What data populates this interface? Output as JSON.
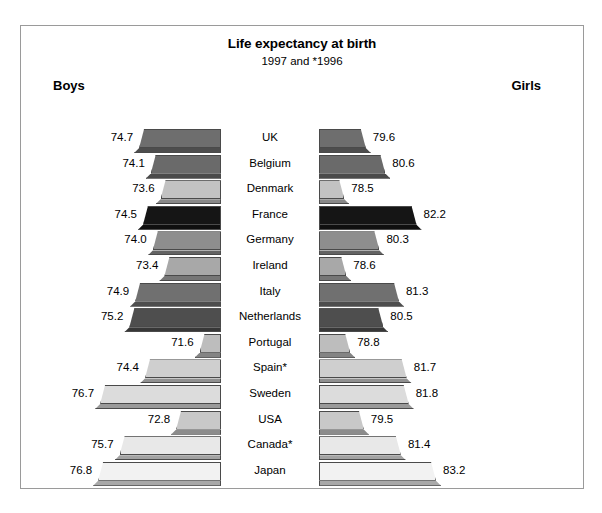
{
  "header": {
    "title": "Life expectancy at birth",
    "subtitle": "1997 and *1996",
    "boys_label": "Boys",
    "girls_label": "Girls"
  },
  "chart_data": {
    "type": "bar",
    "orientation": "horizontal-bidirectional",
    "title": "Life expectancy at birth",
    "subtitle": "1997 and *1996",
    "xlabel": "",
    "ylabel": "",
    "grid": false,
    "legend_position": "top (Boys left, Girls right)",
    "note": "* indicates 1996 data (Spain*, Canada*)",
    "categories": [
      "UK",
      "Belgium",
      "Denmark",
      "France",
      "Germany",
      "Ireland",
      "Italy",
      "Netherlands",
      "Portugal",
      "Spain*",
      "Sweden",
      "USA",
      "Canada*",
      "Japan"
    ],
    "series": [
      {
        "name": "Boys",
        "side": "left",
        "values": [
          74.7,
          74.1,
          73.6,
          74.5,
          74.0,
          73.4,
          74.9,
          75.2,
          71.6,
          74.4,
          76.7,
          72.8,
          75.7,
          76.8
        ]
      },
      {
        "name": "Girls",
        "side": "right",
        "values": [
          79.6,
          80.6,
          78.5,
          82.2,
          80.3,
          78.6,
          81.3,
          80.5,
          78.8,
          81.7,
          81.8,
          79.5,
          81.4,
          83.2
        ]
      }
    ],
    "bar_colors": [
      "#6e6e6e",
      "#6a6a6a",
      "#c2c2c2",
      "#151515",
      "#8e8e8e",
      "#a8a8a8",
      "#707070",
      "#4e4e4e",
      "#bdbdbd",
      "#cfcfcf",
      "#dcdcdc",
      "#c8c8c8",
      "#e8e8e8",
      "#f2f2f2"
    ],
    "boys_axis_min": 70.5,
    "girls_axis_min": 77.2
  }
}
